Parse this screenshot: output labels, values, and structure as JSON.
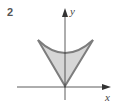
{
  "figure": {
    "number_label": "2",
    "x_axis_label": "x",
    "y_axis_label": "y",
    "colors": {
      "region_fill": "#d6d6d6",
      "region_stroke": "#7d7d7d",
      "axis": "#333333"
    },
    "shape": {
      "description": "Shaded region bounded by a concave-up curve on top and two straight lines meeting at the origin",
      "vertex": [
        0,
        0
      ],
      "upper_curve": "concave-up, minimum on y-axis",
      "sides": "straight lines from curve endpoints to origin"
    }
  }
}
